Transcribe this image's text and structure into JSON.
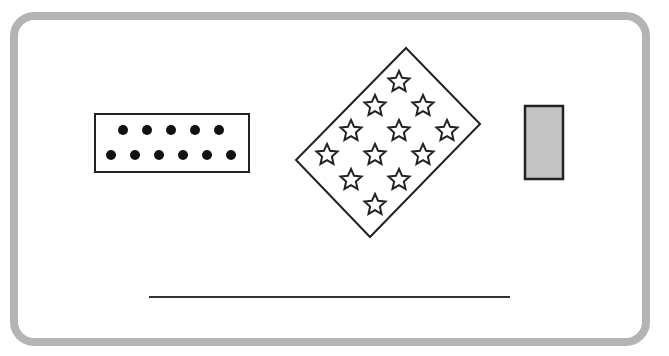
{
  "diagram": {
    "frame": {
      "border_color": "#b4b4b4",
      "fill": "#ffffff"
    },
    "dot_box": {
      "rows": [
        5,
        6
      ],
      "dot_count": 11,
      "dot_color": "#111111",
      "stroke": "#222222"
    },
    "star_card": {
      "star_count": 13,
      "stroke": "#222222",
      "star_grid_rows": [
        [
          1
        ],
        [
          1,
          1
        ],
        [
          1,
          1,
          1
        ],
        [
          1,
          1,
          1
        ],
        [
          1,
          1,
          1
        ]
      ]
    },
    "gray_block": {
      "fill": "#c4c4c4",
      "stroke": "#222222"
    },
    "baseline": {
      "stroke": "#333333"
    }
  }
}
